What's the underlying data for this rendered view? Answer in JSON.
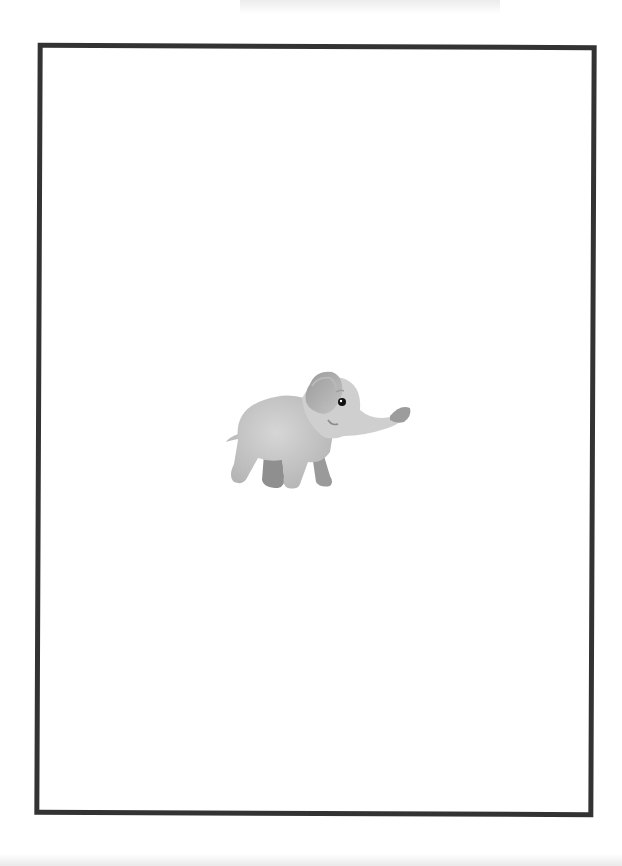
{
  "page": {
    "type": "printable blank page with border",
    "background": "#ffffff"
  },
  "frame": {
    "border_color": "#333333",
    "border_width_px": 5
  },
  "illustration": {
    "subject": "baby elephant",
    "description": "Cartoon gray baby elephant facing right, trunk raised",
    "colors": {
      "body": "#c9c9c9",
      "ear_inner": "#a8a8a8",
      "feet": "#8e8e8e",
      "eye": "#111111"
    }
  }
}
